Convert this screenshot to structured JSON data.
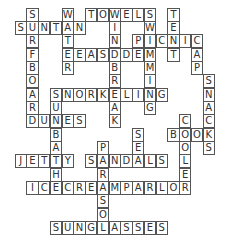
{
  "puzzle": {
    "type": "crossword",
    "theme": "beach",
    "grid_cols": 17,
    "grid_rows": 17,
    "words": [
      {
        "word": "SURFBOARD",
        "row": 0,
        "col": 1,
        "dir": "down"
      },
      {
        "word": "WATER",
        "row": 0,
        "col": 4,
        "dir": "down"
      },
      {
        "word": "TOWELS",
        "row": 0,
        "col": 6,
        "dir": "across"
      },
      {
        "word": "WINDBREAK",
        "row": 0,
        "col": 8,
        "dir": "down"
      },
      {
        "word": "SWIMMING",
        "row": 0,
        "col": 11,
        "dir": "down"
      },
      {
        "word": "TENT",
        "row": 0,
        "col": 13,
        "dir": "down"
      },
      {
        "word": "SUNTAN",
        "row": 1,
        "col": 0,
        "dir": "across"
      },
      {
        "word": "PICNIC",
        "row": 2,
        "col": 10,
        "dir": "across"
      },
      {
        "word": "CAP",
        "row": 2,
        "col": 15,
        "dir": "down"
      },
      {
        "word": "SEASIDE",
        "row": 3,
        "col": 4,
        "dir": "across"
      },
      {
        "word": "SNACKS",
        "row": 5,
        "col": 16,
        "dir": "down"
      },
      {
        "word": "SNORKELING",
        "row": 6,
        "col": 3,
        "dir": "across"
      },
      {
        "word": "SUNBATHE",
        "row": 6,
        "col": 3,
        "dir": "down"
      },
      {
        "word": "DUNES",
        "row": 8,
        "col": 1,
        "dir": "across"
      },
      {
        "word": "COOLER",
        "row": 8,
        "col": 14,
        "dir": "down"
      },
      {
        "word": "SEA",
        "row": 9,
        "col": 10,
        "dir": "down"
      },
      {
        "word": "BOOK",
        "row": 9,
        "col": 13,
        "dir": "across"
      },
      {
        "word": "PARASOL",
        "row": 10,
        "col": 7,
        "dir": "down"
      },
      {
        "word": "JETTY",
        "row": 11,
        "col": 0,
        "dir": "across"
      },
      {
        "word": "SANDALS",
        "row": 11,
        "col": 6,
        "dir": "across"
      },
      {
        "word": "ICECREAMPARLOR",
        "row": 13,
        "col": 1,
        "dir": "across"
      },
      {
        "word": "SUNGLASSES",
        "row": 16,
        "col": 3,
        "dir": "across"
      }
    ]
  }
}
